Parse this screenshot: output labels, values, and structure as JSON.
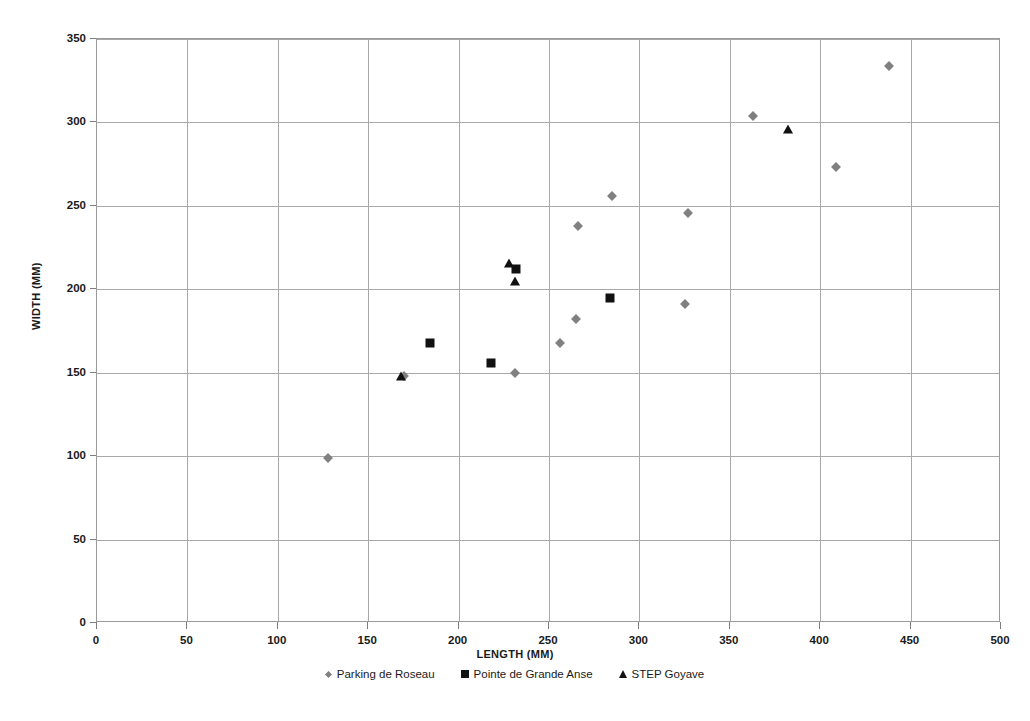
{
  "chart_data": {
    "type": "scatter",
    "title": "",
    "xlabel": "LENGTH (MM)",
    "ylabel": "WIDTH (MM)",
    "xlim": [
      0,
      500
    ],
    "ylim": [
      0,
      350
    ],
    "xticks": [
      0,
      50,
      100,
      150,
      200,
      250,
      300,
      350,
      400,
      450,
      500
    ],
    "yticks": [
      0,
      50,
      100,
      150,
      200,
      250,
      300,
      350
    ],
    "xtick_labels": [
      "0",
      "50",
      "100",
      "150",
      "200",
      "250",
      "300",
      "350",
      "400",
      "450",
      "500"
    ],
    "ytick_labels": [
      "0",
      "50",
      "100",
      "150",
      "200",
      "250",
      "300",
      "350"
    ],
    "grid": true,
    "legend_position": "bottom",
    "series": [
      {
        "name": "Parking de Roseau",
        "marker": "diamond",
        "color": "#808080",
        "points": [
          [
            128,
            99
          ],
          [
            170,
            148
          ],
          [
            231,
            150
          ],
          [
            256,
            168
          ],
          [
            265,
            182
          ],
          [
            266,
            238
          ],
          [
            285,
            256
          ],
          [
            325,
            191
          ],
          [
            327,
            246
          ],
          [
            363,
            304
          ],
          [
            409,
            273
          ],
          [
            438,
            334
          ]
        ]
      },
      {
        "name": "Pointe de Grande Anse",
        "marker": "square",
        "color": "#111111",
        "points": [
          [
            184,
            168
          ],
          [
            218,
            156
          ],
          [
            232,
            212
          ],
          [
            284,
            195
          ]
        ]
      },
      {
        "name": "STEP Goyave",
        "marker": "triangle",
        "color": "#111111",
        "points": [
          [
            168,
            148
          ],
          [
            228,
            216
          ],
          [
            231,
            205
          ],
          [
            382,
            296
          ]
        ]
      }
    ]
  }
}
